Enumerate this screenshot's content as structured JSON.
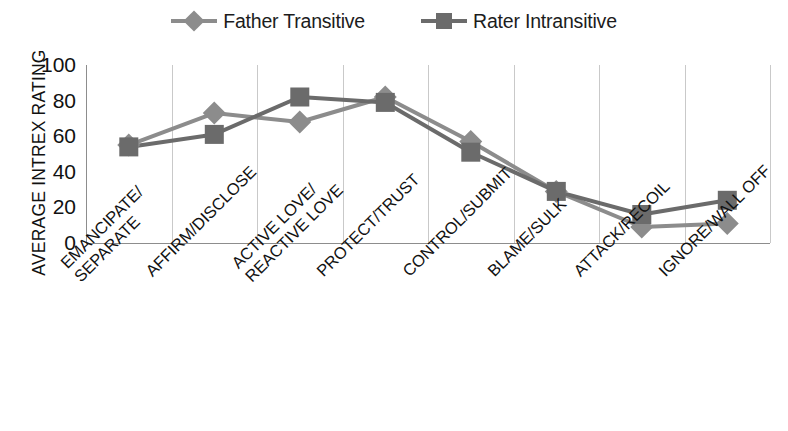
{
  "legend": {
    "position": "top-center",
    "entries": [
      {
        "label": "Father Transitive",
        "marker": "diamond-marker-icon",
        "color": "#8c8c8c"
      },
      {
        "label": "Rater Intransitive",
        "marker": "square-marker-icon",
        "color": "#6b6b6b"
      }
    ]
  },
  "axes": {
    "ylabel": "AVERAGE INTREX RATING",
    "xlabel": "",
    "yticks": [
      "100",
      "80",
      "60",
      "40",
      "20",
      "0"
    ]
  },
  "chart_data": {
    "type": "line",
    "title": "",
    "xlabel": "",
    "ylabel": "AVERAGE INTREX RATING",
    "ylim": [
      0,
      100
    ],
    "ytick_values": [
      0,
      20,
      40,
      60,
      80,
      100
    ],
    "grid": "vertical",
    "legend_position": "top-center",
    "categories": [
      "EMANCIPATE/\nSEPARATE",
      "AFFIRM/DISCLOSE",
      "ACTIVE LOVE/\nREACTIVE LOVE",
      "PROTECT/TRUST",
      "CONTROL/SUBMIT",
      "BLAME/SULK",
      "ATTACK/RECOIL",
      "IGNORE/WALL OFF"
    ],
    "series": [
      {
        "name": "Father Transitive",
        "marker": "diamond",
        "color": "#8c8c8c",
        "values": [
          55,
          73,
          68,
          82,
          57,
          29,
          9,
          11
        ]
      },
      {
        "name": "Rater Intransitive",
        "marker": "square",
        "color": "#6b6b6b",
        "values": [
          54,
          61,
          82,
          79,
          51,
          29,
          16,
          24
        ]
      }
    ]
  },
  "xlabels": [
    {
      "line1": "EMANCIPATE/",
      "line2": "SEPARATE"
    },
    {
      "line1": "AFFIRM/DISCLOSE",
      "line2": ""
    },
    {
      "line1": "ACTIVE LOVE/",
      "line2": "REACTIVE LOVE"
    },
    {
      "line1": "PROTECT/TRUST",
      "line2": ""
    },
    {
      "line1": "CONTROL/SUBMIT",
      "line2": ""
    },
    {
      "line1": "BLAME/SULK",
      "line2": ""
    },
    {
      "line1": "ATTACK/RECOIL",
      "line2": ""
    },
    {
      "line1": "IGNORE/WALL OFF",
      "line2": ""
    }
  ]
}
